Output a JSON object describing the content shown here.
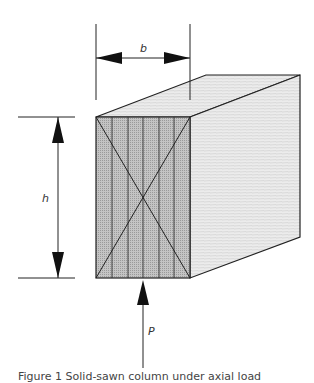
{
  "figure": {
    "labels": {
      "width": "b",
      "height": "h",
      "load": "P"
    },
    "caption": "Figure 1 Solid-sawn column under axial load",
    "colors": {
      "front_face": "#b8b8b8",
      "side_face": "#ececec",
      "top_face": "#e4e4e4",
      "outline": "#222222"
    }
  }
}
